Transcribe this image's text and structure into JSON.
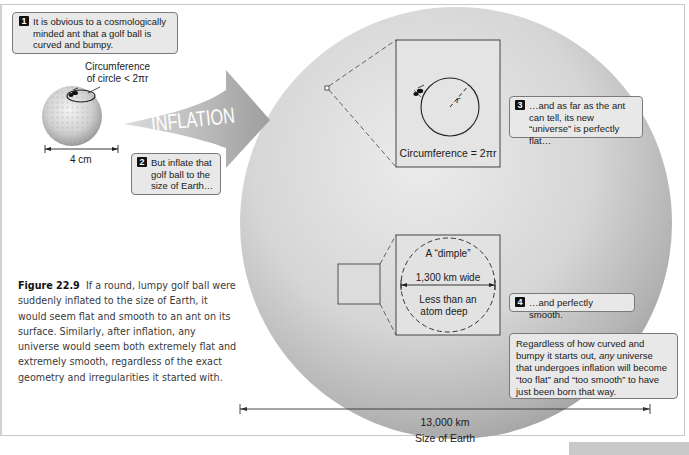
{
  "figure": {
    "number_label": "Figure 22.9",
    "caption": "If a round, lumpy golf ball were suddenly inflated to the size of Earth, it would seem flat and smooth to an ant on its surface. Similarly, after inflation, any universe would seem both extremely flat and extremely smooth, regardless of the exact geometry and irregularities it started with."
  },
  "callouts": [
    {
      "num": "1",
      "text": "It is obvious to a cosmologically minded ant that a golf ball is curved and bumpy."
    },
    {
      "num": "2",
      "text": "But inflate that golf ball to the size of Earth…"
    },
    {
      "num": "3",
      "text": "…and as far as the ant can tell, its new “universe” is perfectly flat…"
    },
    {
      "num": "4",
      "text": "…and perfectly smooth."
    }
  ],
  "summary_box": {
    "before": "Regardless of how curved and bumpy it starts out, ",
    "emph": "any",
    "after": " universe that undergoes inflation will become “too flat” and “too smooth” to have just been born that way."
  },
  "golf_ball": {
    "circ_label_line1": "Circumference",
    "circ_label_line2": "of circle < 2πr",
    "size_label": "4 cm"
  },
  "arrow": {
    "label": "INFLATION"
  },
  "flat_inset": {
    "radius_label": "r",
    "circ_label": "Circumference = 2πr"
  },
  "dimple_inset": {
    "title": "A “dimple”",
    "width_label": "1,300 km wide",
    "depth_line1": "Less than an",
    "depth_line2": "atom deep"
  },
  "earth": {
    "size_value": "13,000 km",
    "size_label": "Size of Earth"
  },
  "colors": {
    "callout_bg": "#e8e8e8",
    "callout_border": "#7a7a7a",
    "sphere_light": "#e6e6e6",
    "sphere_dark": "#9c9c9c"
  }
}
